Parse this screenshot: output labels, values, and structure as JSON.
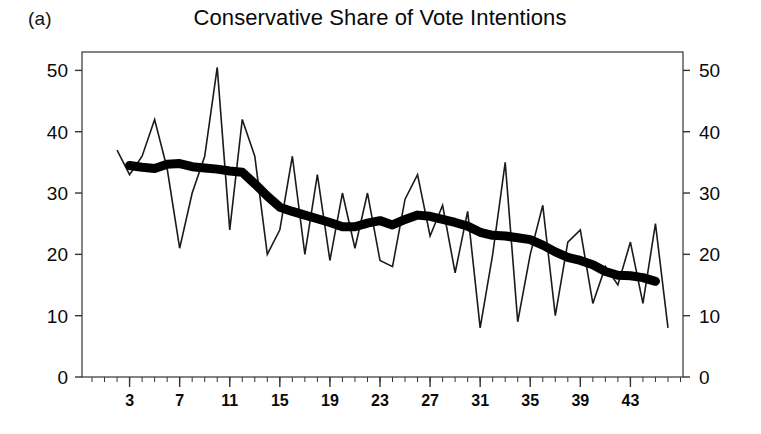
{
  "panel": {
    "label": "(a)"
  },
  "chart_data": {
    "type": "line",
    "title": "Conservative Share of Vote Intentions",
    "xlabel": "",
    "ylabel": "",
    "xlim": [
      -0.8,
      47.2
    ],
    "ylim": [
      0,
      53
    ],
    "grid": false,
    "legend": "none",
    "yticks": [
      0,
      10,
      20,
      30,
      40,
      50
    ],
    "ytick_labels": [
      "0",
      "10",
      "20",
      "30",
      "40",
      "50"
    ],
    "y_axis_right": true,
    "y_right_tick_labels": [
      "0",
      "10",
      "20",
      "30",
      "40",
      "50"
    ],
    "xticks": [
      3,
      7,
      11,
      15,
      19,
      23,
      27,
      31,
      35,
      39,
      43
    ],
    "xtick_labels": [
      "3",
      "7",
      "11",
      "15",
      "19",
      "23",
      "27",
      "31",
      "35",
      "39",
      "43"
    ],
    "x_minor_tick_step": 1,
    "x": [
      2,
      3,
      4,
      5,
      6,
      7,
      8,
      9,
      10,
      11,
      12,
      13,
      14,
      15,
      16,
      17,
      18,
      19,
      20,
      21,
      22,
      23,
      24,
      25,
      26,
      27,
      28,
      29,
      30,
      31,
      32,
      33,
      34,
      35,
      36,
      37,
      38,
      39,
      40,
      41,
      42,
      43,
      44,
      45,
      46
    ],
    "series": [
      {
        "name": "Raw vote intention share",
        "style": "thin",
        "color": "#1a1a1a",
        "values": [
          37,
          33,
          36,
          42,
          34,
          21,
          30,
          36,
          50.5,
          24,
          42,
          36,
          20,
          24,
          36,
          20,
          33,
          19,
          30,
          21,
          30,
          19,
          18,
          29,
          33,
          23,
          28,
          17,
          27,
          8,
          20,
          35,
          9,
          20,
          28,
          10,
          22,
          24,
          12,
          18,
          15,
          22,
          12,
          25,
          8
        ]
      },
      {
        "name": "Smoothed trend",
        "style": "thick",
        "color": "#000000",
        "values": [
          null,
          34.5,
          34.2,
          34.0,
          34.7,
          34.8,
          34.3,
          34.1,
          33.9,
          33.6,
          33.4,
          31.5,
          29.5,
          27.7,
          27.0,
          26.4,
          25.8,
          25.2,
          24.5,
          24.5,
          25.1,
          25.5,
          24.8,
          25.7,
          26.4,
          26.2,
          25.7,
          25.2,
          24.6,
          23.6,
          23.1,
          23.0,
          22.7,
          22.4,
          21.5,
          20.4,
          19.5,
          19.0,
          18.3,
          17.2,
          16.6,
          16.5,
          16.2,
          15.6,
          null
        ]
      }
    ]
  }
}
